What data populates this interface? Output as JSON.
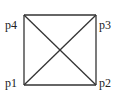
{
  "diagram": {
    "type": "square-with-diagonals",
    "points": [
      {
        "id": "p1",
        "label": "p1",
        "position": "bottom-left"
      },
      {
        "id": "p2",
        "label": "p2",
        "position": "bottom-right"
      },
      {
        "id": "p3",
        "label": "p3",
        "position": "top-right"
      },
      {
        "id": "p4",
        "label": "p4",
        "position": "top-left"
      }
    ],
    "edges": [
      [
        "p1",
        "p2"
      ],
      [
        "p2",
        "p3"
      ],
      [
        "p3",
        "p4"
      ],
      [
        "p4",
        "p1"
      ],
      [
        "p1",
        "p3"
      ],
      [
        "p2",
        "p4"
      ]
    ],
    "stroke_color": "#333333"
  }
}
